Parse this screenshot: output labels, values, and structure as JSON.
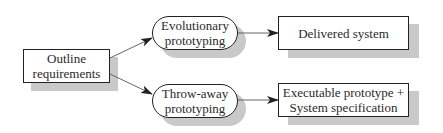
{
  "diagram": {
    "nodes": {
      "outline": {
        "line1": "Outline",
        "line2": "requirements"
      },
      "evolutionary": {
        "line1": "Evolutionary",
        "line2": "prototyping"
      },
      "throwaway": {
        "line1": "Throw-away",
        "line2": "prototyping"
      },
      "delivered": {
        "line1": "Delivered system"
      },
      "executable": {
        "line1": "Executable prototype +",
        "line2": "System specification"
      }
    },
    "edges": [
      {
        "from": "outline",
        "to": "evolutionary"
      },
      {
        "from": "outline",
        "to": "throwaway"
      },
      {
        "from": "evolutionary",
        "to": "delivered"
      },
      {
        "from": "throwaway",
        "to": "executable"
      }
    ],
    "colors": {
      "line": "#222222",
      "shadow": "#c9c9c9",
      "background": "#ffffff"
    }
  }
}
